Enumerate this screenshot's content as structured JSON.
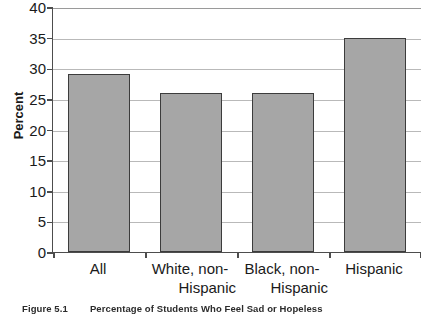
{
  "figure": {
    "caption_number": "Figure 5.1",
    "caption_text": "Percentage of Students Who Feel Sad or Hopeless"
  },
  "chart_data": {
    "type": "bar",
    "title": "",
    "subtitle": "",
    "xlabel": "",
    "ylabel": "Percent",
    "ylim": [
      0,
      40
    ],
    "ytick_step": 5,
    "ytick_labels": [
      "0",
      "5",
      "10",
      "15",
      "20",
      "25",
      "30",
      "35",
      "40"
    ],
    "ytick_values": [
      0,
      5,
      10,
      15,
      20,
      25,
      30,
      35,
      40
    ],
    "grid": true,
    "grid_axis": "y",
    "legend": false,
    "legend_position": "none",
    "categories": [
      "All",
      "White, non-Hispanic",
      "Black, non-Hispanic",
      "Hispanic"
    ],
    "category_lines": [
      [
        "All"
      ],
      [
        "White, non-",
        "Hispanic"
      ],
      [
        "Black, non-",
        "Hispanic"
      ],
      [
        "Hispanic"
      ]
    ],
    "values": [
      29,
      26,
      26,
      35
    ],
    "bar_color": "#a6a6a6",
    "bar_border_color": "#3c3c3c",
    "grid_color": "#b9b9b9",
    "axis_color": "#4d4d4d"
  }
}
